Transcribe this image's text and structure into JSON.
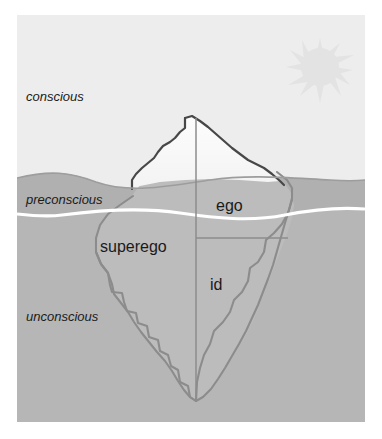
{
  "figure": {
    "canvas": {
      "width": 382,
      "height": 439
    },
    "plate": {
      "x": 17,
      "y": 15,
      "width": 348,
      "height": 407
    }
  },
  "colors": {
    "page_background": "#ffffff",
    "sky": "#eeeeee",
    "water_surface_band": "#b1b1b1",
    "water_deep": "#b7b7b7",
    "iceberg_tip": "#fbfbfb",
    "iceberg_tip_shade": "#f0f0f0",
    "iceberg_outline_above": "#4a4a4a",
    "iceberg_outline_below": "#8a8a8a",
    "waterline_white": "#ffffff",
    "sun": "#e2e2e2",
    "label_text": "#1a1a1a"
  },
  "labels": {
    "conscious": "conscious",
    "preconscious": "preconscious",
    "unconscious": "unconscious",
    "ego": "ego",
    "superego": "superego",
    "id": "id"
  },
  "label_positions": {
    "conscious": {
      "x": 26,
      "y": 101,
      "style": "italic"
    },
    "preconscious": {
      "x": 26,
      "y": 204,
      "style": "italic"
    },
    "unconscious": {
      "x": 26,
      "y": 321,
      "style": "italic"
    },
    "ego": {
      "x": 216,
      "y": 211,
      "style": "plain"
    },
    "superego": {
      "x": 100,
      "y": 252,
      "style": "plain"
    },
    "id": {
      "x": 210,
      "y": 290,
      "style": "plain"
    }
  },
  "icons": {
    "sun": {
      "name": "sun-icon",
      "center_x": 320,
      "center_y": 67,
      "radius": 20,
      "ray_count": 16
    }
  },
  "shapes": {
    "iceberg_tip_outline": "M 185 118 L 185 118 L 190 124 L 196 131 L 205 141 L 214 150 L 224 157 L 234 163 L 244 168 L 252 172 L 258 176 L 262 179 L 265 180 L 268 179 L 272 176 L 274 171 L 276 167 L 279 166 L 282 168 L 285 170 L 289 170 L 293 168 L 296 167",
    "iceberg_underwater_left": "M 133 196 L 128 200 L 120 205 L 112 211 L 105 218 L 99 226 L 96 236 L 95 248 L 95 260 L 99 270 L 105 277 L 110 283 L 112 292 L 115 300 L 122 307 L 128 313 L 134 320 L 140 329 L 147 338 L 154 346 L 161 354 L 168 361 L 174 369 L 178 378 L 183 386 L 188 393 L 193 398 L 196 401",
    "center_line_top_y": 118,
    "center_line_bottom_y": 401,
    "center_line_x": 196,
    "divider_y": 238,
    "divider_x_start": 196,
    "divider_x_end": 300
  },
  "waterline": {
    "surface_y_mean": 182,
    "white_line_y_mean": 212
  }
}
